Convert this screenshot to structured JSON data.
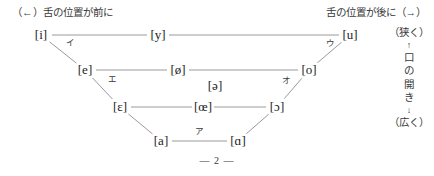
{
  "header": {
    "front_caption": "（←）舌の位置が前に",
    "back_caption": "舌の位置が後に（→）"
  },
  "openness_legend": {
    "narrow_label": "（狭く）",
    "up_arrow": "↑",
    "chars": [
      "口",
      "の",
      "開",
      "き"
    ],
    "down_arrow": "↓",
    "wide_label": "（広く）"
  },
  "footer": {
    "page_number": "— 2 —"
  },
  "colors": {
    "line": "#9a9a9a",
    "text": "#1d1d1d",
    "caption": "#3a3a3a",
    "background": "#ffffff"
  },
  "chart_data": {
    "type": "scatter",
    "title": "",
    "xlabel": "舌の位置が前に ←→ 舌の位置が後に",
    "ylabel": "口の開き（狭く ↑ ↓ 広く）",
    "grid": false,
    "legend": "none",
    "xlim": [
      0,
      434
    ],
    "ylim": [
      0,
      176
    ],
    "rows": [
      {
        "name": "close",
        "openness": "狭く",
        "vowels": [
          "i",
          "y",
          "u"
        ]
      },
      {
        "name": "close-mid",
        "openness": "",
        "vowels": [
          "e",
          "ø",
          "o"
        ]
      },
      {
        "name": "mid-central",
        "openness": "",
        "vowels": [
          "ə"
        ]
      },
      {
        "name": "open-mid",
        "openness": "",
        "vowels": [
          "ɛ",
          "œ",
          "ɔ"
        ]
      },
      {
        "name": "open",
        "openness": "広く",
        "vowels": [
          "a",
          "ɑ"
        ]
      }
    ],
    "points": [
      {
        "id": "i",
        "label": "[i]",
        "x": 41,
        "y": 35,
        "row": 0,
        "backness": "front",
        "height": "close"
      },
      {
        "id": "y",
        "label": "[y]",
        "x": 158,
        "y": 35,
        "row": 0,
        "backness": "front",
        "height": "close"
      },
      {
        "id": "u",
        "label": "[u]",
        "x": 350,
        "y": 35,
        "row": 0,
        "backness": "back",
        "height": "close"
      },
      {
        "id": "e",
        "label": "[e]",
        "x": 85,
        "y": 70,
        "row": 1,
        "backness": "front",
        "height": "close-mid"
      },
      {
        "id": "oslash",
        "label": "[ø]",
        "x": 178,
        "y": 70,
        "row": 1,
        "backness": "front",
        "height": "close-mid"
      },
      {
        "id": "o",
        "label": "[o]",
        "x": 309,
        "y": 70,
        "row": 1,
        "backness": "back",
        "height": "close-mid"
      },
      {
        "id": "schwa",
        "label": "[ə]",
        "x": 215,
        "y": 86,
        "row": 2,
        "backness": "central",
        "height": "mid"
      },
      {
        "id": "epsilon",
        "label": "[ɛ]",
        "x": 120,
        "y": 107,
        "row": 3,
        "backness": "front",
        "height": "open-mid"
      },
      {
        "id": "oe",
        "label": "[œ]",
        "x": 203,
        "y": 107,
        "row": 3,
        "backness": "front",
        "height": "open-mid"
      },
      {
        "id": "openo",
        "label": "[ɔ]",
        "x": 277,
        "y": 107,
        "row": 3,
        "backness": "back",
        "height": "open-mid"
      },
      {
        "id": "a",
        "label": "[a]",
        "x": 161,
        "y": 141,
        "row": 4,
        "backness": "front",
        "height": "open"
      },
      {
        "id": "scripta",
        "label": "[ɑ]",
        "x": 238,
        "y": 141,
        "row": 4,
        "backness": "back",
        "height": "open"
      }
    ],
    "kana_annotations": [
      {
        "id": "kana-i",
        "label": "イ",
        "x": 70,
        "y": 42,
        "near": "i"
      },
      {
        "id": "kana-u",
        "label": "ウ",
        "x": 330,
        "y": 43,
        "near": "u"
      },
      {
        "id": "kana-e",
        "label": "エ",
        "x": 112,
        "y": 79,
        "near": "e"
      },
      {
        "id": "kana-o",
        "label": "オ",
        "x": 286,
        "y": 80,
        "near": "o"
      },
      {
        "id": "kana-a",
        "label": "ア",
        "x": 199,
        "y": 131,
        "near": "a"
      }
    ],
    "connectors": [
      {
        "from": "i",
        "to": "y",
        "kind": "horizontal"
      },
      {
        "from": "y",
        "to": "u",
        "kind": "horizontal"
      },
      {
        "from": "e",
        "to": "oslash",
        "kind": "horizontal"
      },
      {
        "from": "oslash",
        "to": "o",
        "kind": "horizontal"
      },
      {
        "from": "epsilon",
        "to": "oe",
        "kind": "horizontal"
      },
      {
        "from": "oe",
        "to": "openo",
        "kind": "horizontal"
      },
      {
        "from": "a",
        "to": "scripta",
        "kind": "horizontal"
      },
      {
        "from": "i",
        "to": "e",
        "kind": "diagonal-left"
      },
      {
        "from": "e",
        "to": "epsilon",
        "kind": "diagonal-left"
      },
      {
        "from": "epsilon",
        "to": "a",
        "kind": "diagonal-left"
      },
      {
        "from": "u",
        "to": "o",
        "kind": "diagonal-right"
      },
      {
        "from": "o",
        "to": "openo",
        "kind": "diagonal-right"
      },
      {
        "from": "openo",
        "to": "scripta",
        "kind": "diagonal-right"
      }
    ]
  }
}
